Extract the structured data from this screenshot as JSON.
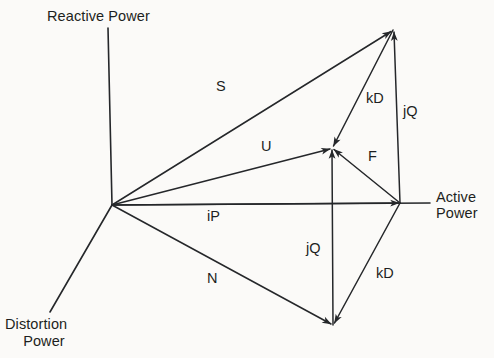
{
  "figure": {
    "type": "vector-diagram",
    "background_color": "#fbfaf8",
    "stroke_color": "#25272a"
  },
  "axes": [
    {
      "id": "reactive",
      "label": "Reactive Power",
      "label_lines": [
        "Reactive Power"
      ],
      "direction": "up",
      "from": [
        112,
        205
      ],
      "to": [
        108,
        28
      ]
    },
    {
      "id": "active",
      "label": "Active Power",
      "label_lines": [
        "Active",
        "Power"
      ],
      "direction": "right",
      "from": [
        112,
        205
      ],
      "to": [
        430,
        203
      ]
    },
    {
      "id": "distortion",
      "label": "Distortion Power",
      "label_lines": [
        "Distortion",
        "Power"
      ],
      "direction": "down-left",
      "from": [
        112,
        205
      ],
      "to": [
        50,
        312
      ]
    }
  ],
  "nodes": {
    "origin": [
      112,
      205
    ],
    "apex": [
      393,
      30
    ],
    "mid": [
      332,
      148
    ],
    "active_tip": [
      400,
      203
    ],
    "bottom": [
      333,
      325
    ]
  },
  "vectors": [
    {
      "id": "S",
      "label": "S",
      "from": [
        112,
        205
      ],
      "to": [
        393,
        30
      ],
      "label_pos": [
        216,
        78
      ]
    },
    {
      "id": "U",
      "label": "U",
      "from": [
        112,
        205
      ],
      "to": [
        332,
        148
      ],
      "label_pos": [
        261,
        138
      ]
    },
    {
      "id": "iP",
      "label": "iP",
      "from": [
        112,
        205
      ],
      "to": [
        400,
        203
      ],
      "label_pos": [
        207,
        208
      ]
    },
    {
      "id": "N",
      "label": "N",
      "from": [
        112,
        205
      ],
      "to": [
        333,
        325
      ],
      "label_pos": [
        207,
        270
      ]
    },
    {
      "id": "kD_upper",
      "label": "kD",
      "from": [
        393,
        30
      ],
      "to": [
        332,
        148
      ],
      "label_pos": [
        366,
        90
      ]
    },
    {
      "id": "jQ_upper",
      "label": "jQ",
      "from": [
        400,
        203
      ],
      "to": [
        393,
        30
      ],
      "label_pos": [
        403,
        103
      ]
    },
    {
      "id": "F",
      "label": "F",
      "from": [
        400,
        203
      ],
      "to": [
        332,
        148
      ],
      "label_pos": [
        368,
        148
      ]
    },
    {
      "id": "jQ_lower",
      "label": "jQ",
      "from": [
        333,
        325
      ],
      "to": [
        332,
        148
      ],
      "label_pos": [
        306,
        240
      ]
    },
    {
      "id": "kD_lower",
      "label": "kD",
      "from": [
        400,
        203
      ],
      "to": [
        333,
        325
      ],
      "label_pos": [
        376,
        265
      ]
    }
  ],
  "labels": {
    "reactive_power": "Reactive Power",
    "active_power_line1": "Active",
    "active_power_line2": "Power",
    "distortion_power_line1": "Distortion",
    "distortion_power_line2": "Power",
    "s": "S",
    "u": "U",
    "ip": "iP",
    "n": "N",
    "kd_upper": "kD",
    "jq_upper": "jQ",
    "f": "F",
    "jq_lower": "jQ",
    "kd_lower": "kD"
  }
}
